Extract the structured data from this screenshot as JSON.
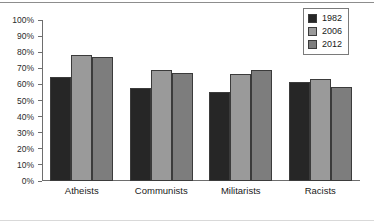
{
  "chart_data": {
    "type": "bar",
    "title": "",
    "subtitle": "",
    "xlabel": "",
    "ylabel": "",
    "ylim": [
      0,
      100
    ],
    "ytick_labels": [
      "100%",
      "90%",
      "80%",
      "70%",
      "60%",
      "50%",
      "40%",
      "30%",
      "20%",
      "10%",
      "0%"
    ],
    "ytick_values": [
      100,
      90,
      80,
      70,
      60,
      50,
      40,
      30,
      20,
      10,
      0
    ],
    "grid": false,
    "legend_position": "top-right",
    "categories": [
      "Atheists",
      "Communists",
      "Militarists",
      "Racists"
    ],
    "series": [
      {
        "name": "1982",
        "color": "#262626",
        "values": [
          64.5,
          57.5,
          55.0,
          61.5
        ]
      },
      {
        "name": "2006",
        "color": "#9a9a9a",
        "values": [
          78.0,
          69.0,
          66.5,
          63.5
        ]
      },
      {
        "name": "2012",
        "color": "#7d7d7d",
        "values": [
          77.0,
          67.0,
          69.0,
          58.5
        ]
      }
    ]
  },
  "colors": {
    "axis": "#6e6e6e",
    "bar_outline": "#3b3b3b",
    "text": "#1a1a1a",
    "frame_rule": "#8d8d8d"
  }
}
